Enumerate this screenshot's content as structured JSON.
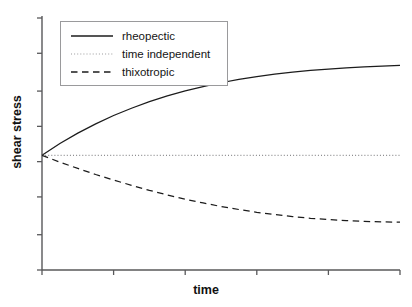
{
  "figure": {
    "background": "#ffffff",
    "width": 412,
    "height": 307
  },
  "axes": {
    "x_title": "time",
    "y_title": "shear stress",
    "axis_color": "#58585a",
    "x_tick_count": 6,
    "y_tick_count": 8
  },
  "legend": {
    "position": "upper-left-inside",
    "border_color": "#9a9a9c",
    "entries": [
      {
        "label": "rheopectic",
        "style": "solid",
        "color": "#1c1c1c"
      },
      {
        "label": "time independent",
        "style": "dotted",
        "color": "#8d8d8f"
      },
      {
        "label": "thixotropic",
        "style": "dashed",
        "color": "#1c1c1c"
      }
    ]
  },
  "chart_data": {
    "type": "line",
    "title": "",
    "subtitle": "",
    "xlabel": "time",
    "ylabel": "shear stress",
    "xlim": [
      0,
      1
    ],
    "ylim": [
      0,
      1
    ],
    "grid": false,
    "legend_position": "upper left",
    "xticks": [
      0,
      0.2,
      0.4,
      0.6,
      0.8,
      1.0
    ],
    "xticklabels": [
      "",
      "",
      "",
      "",
      "",
      ""
    ],
    "yticks": [
      0,
      0.14,
      0.29,
      0.43,
      0.57,
      0.71,
      0.86,
      1.0
    ],
    "yticklabels": [
      "",
      "",
      "",
      "",
      "",
      "",
      "",
      ""
    ],
    "x": [
      0,
      0.05,
      0.1,
      0.15,
      0.2,
      0.25,
      0.3,
      0.35,
      0.4,
      0.45,
      0.5,
      0.55,
      0.6,
      0.65,
      0.7,
      0.75,
      0.8,
      0.85,
      0.9,
      0.95,
      1.0
    ],
    "series": [
      {
        "name": "rheopectic",
        "style": "solid",
        "color": "#1c1c1c",
        "values": [
          0.455,
          0.502,
          0.543,
          0.58,
          0.613,
          0.642,
          0.668,
          0.691,
          0.711,
          0.728,
          0.743,
          0.756,
          0.767,
          0.777,
          0.785,
          0.792,
          0.797,
          0.802,
          0.806,
          0.809,
          0.812
        ]
      },
      {
        "name": "time independent",
        "style": "dotted",
        "color": "#8d8d8f",
        "values": [
          0.455,
          0.455,
          0.455,
          0.455,
          0.455,
          0.455,
          0.455,
          0.455,
          0.455,
          0.455,
          0.455,
          0.455,
          0.455,
          0.455,
          0.455,
          0.455,
          0.455,
          0.455,
          0.455,
          0.455,
          0.455
        ]
      },
      {
        "name": "thixotropic",
        "style": "dashed",
        "color": "#1c1c1c",
        "values": [
          0.455,
          0.428,
          0.403,
          0.379,
          0.357,
          0.336,
          0.316,
          0.298,
          0.281,
          0.266,
          0.252,
          0.24,
          0.229,
          0.22,
          0.212,
          0.205,
          0.2,
          0.196,
          0.193,
          0.191,
          0.19
        ]
      }
    ]
  }
}
